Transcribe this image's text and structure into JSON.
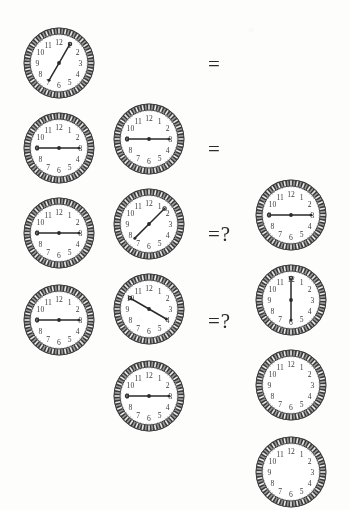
{
  "puzzle": {
    "type": "clock-analogy-sequence",
    "question_mark": "?",
    "equals": "=",
    "equals_question": "=?",
    "numerals": [
      "1",
      "2",
      "3",
      "4",
      "5",
      "6",
      "7",
      "8",
      "9",
      "10",
      "11",
      "12"
    ],
    "colors": {
      "background": "#fdfdfb",
      "bezel_dark": "#3a3a3a",
      "bezel_light": "#9a9a9a",
      "face": "#ffffff",
      "numeral": "#3c3c3c",
      "hand": "#2a2a2a",
      "operator": "#2b2b2b"
    },
    "rows": [
      {
        "index": 1,
        "operator": "=",
        "answer_known": true,
        "clocks": [
          {
            "role": "operand-a",
            "hand_a_deg": 30,
            "hand_b_deg": 210,
            "blank": false,
            "label": "hands toward 1 and 7"
          },
          {
            "role": "operand-b",
            "hand_a_deg": 270,
            "hand_b_deg": 90,
            "blank": false,
            "label": "hands toward 9 and 3"
          },
          {
            "role": "result",
            "hand_a_deg": 270,
            "hand_b_deg": 90,
            "blank": false,
            "label": "hands toward 9 and 3"
          }
        ]
      },
      {
        "index": 2,
        "operator": "=",
        "answer_known": true,
        "clocks": [
          {
            "role": "operand-a",
            "hand_a_deg": 270,
            "hand_b_deg": 90,
            "blank": false,
            "label": "hands toward 9 and 3"
          },
          {
            "role": "operand-b",
            "hand_a_deg": 45,
            "hand_b_deg": 225,
            "blank": false,
            "label": "hands toward 1:30 and 7:30"
          },
          {
            "role": "result",
            "hand_a_deg": 0,
            "hand_b_deg": 180,
            "blank": false,
            "label": "hands toward 12 and 6"
          }
        ]
      },
      {
        "index": 3,
        "operator": "=?",
        "answer_known": false,
        "clocks": [
          {
            "role": "operand-a",
            "hand_a_deg": 270,
            "hand_b_deg": 90,
            "blank": false,
            "label": "hands toward 9 and 3"
          },
          {
            "role": "operand-b",
            "hand_a_deg": 300,
            "hand_b_deg": 120,
            "blank": false,
            "label": "hands toward 10 and 4"
          },
          {
            "role": "result",
            "hand_a_deg": null,
            "hand_b_deg": null,
            "blank": true,
            "label": "blank clock face"
          }
        ]
      },
      {
        "index": 4,
        "operator": "=?",
        "answer_known": false,
        "clocks": [
          {
            "role": "operand-a",
            "hand_a_deg": 270,
            "hand_b_deg": 90,
            "blank": false,
            "label": "hands toward 9 and 3"
          },
          {
            "role": "operand-b",
            "hand_a_deg": 270,
            "hand_b_deg": 90,
            "blank": false,
            "label": "hands toward 9 and 3"
          },
          {
            "role": "result",
            "hand_a_deg": null,
            "hand_b_deg": null,
            "blank": true,
            "label": "blank clock face"
          }
        ]
      }
    ]
  }
}
